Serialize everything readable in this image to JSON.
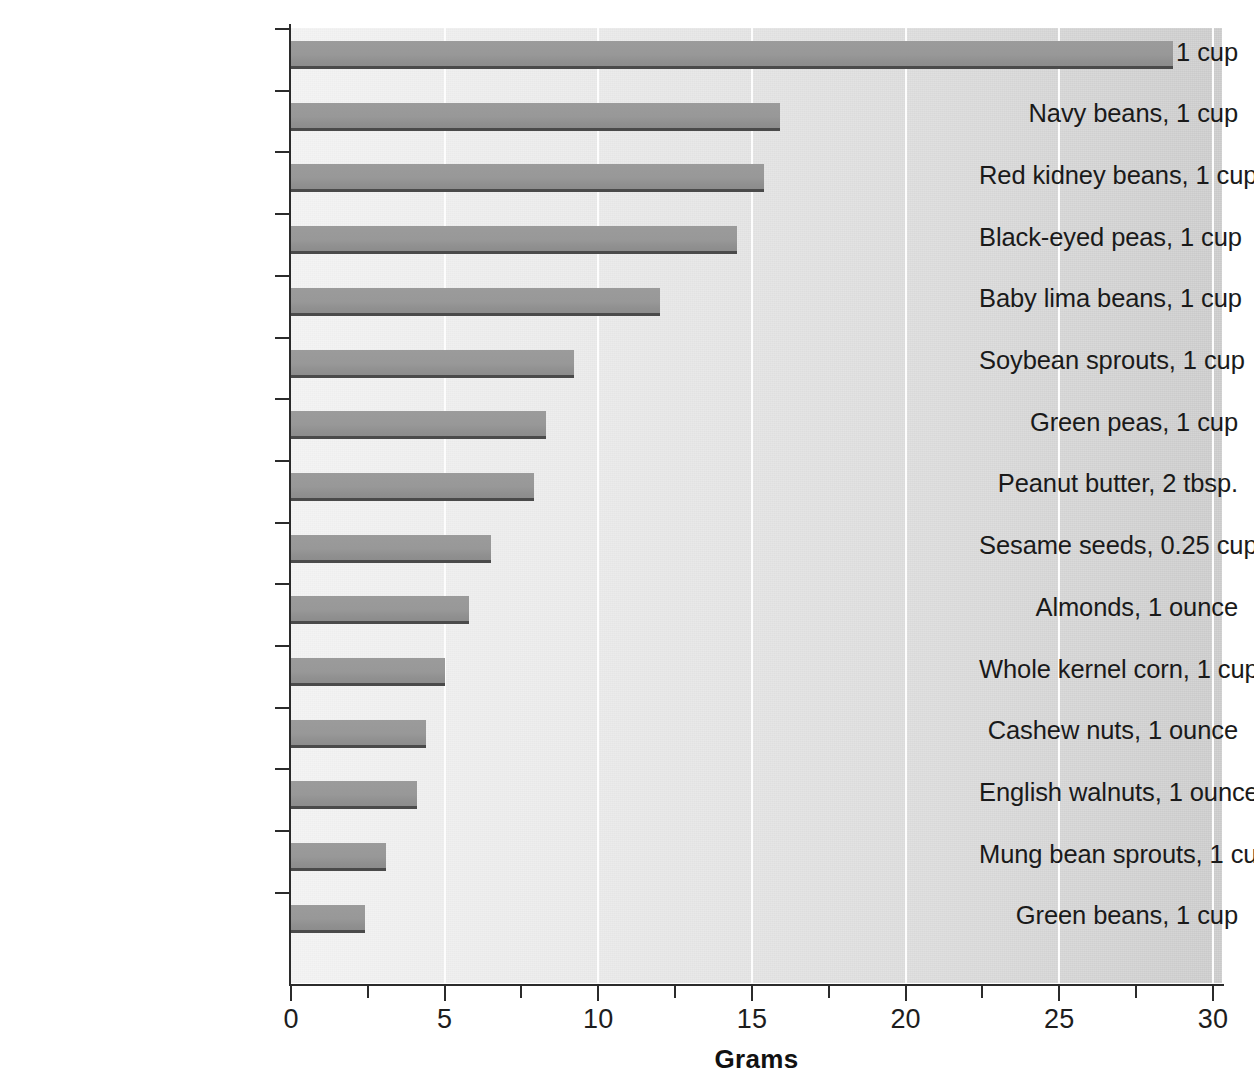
{
  "chart": {
    "type": "bar",
    "orientation": "horizontal",
    "xlabel": "Grams",
    "ylabel": "",
    "title": "",
    "grid": "vertical-white-gridlines",
    "legend": "none"
  },
  "axis": {
    "x_ticks": [
      "0",
      "5",
      "10",
      "15",
      "20",
      "25",
      "30"
    ],
    "x_tick_values": [
      0,
      5,
      10,
      15,
      20,
      25,
      30
    ],
    "x_minor_tick_values": [
      2.5,
      7.5,
      12.5,
      17.5,
      22.5,
      27.5
    ],
    "x_min": 0,
    "x_max": 30
  },
  "colors": {
    "bar_fill": "#989898",
    "bar_edge": "#4a4a4a",
    "axis": "#2b2b2b",
    "gridline": "#fdfdfd",
    "plot_background_left": "#f2f2f2",
    "plot_background_right": "#cbcbcb",
    "label_text": "#1a1a1a"
  },
  "chart_data": {
    "type": "bar",
    "orientation": "horizontal",
    "title": "",
    "xlabel": "Grams",
    "ylabel": "",
    "xlim": [
      0,
      30
    ],
    "grid": true,
    "legend": null,
    "categories": [
      "Soybeans, 1 cup",
      "Navy beans, 1 cup",
      "Red kidney beans, 1 cup",
      "Black-eyed peas, 1 cup",
      "Baby lima beans, 1 cup",
      "Soybean sprouts, 1 cup",
      "Green peas, 1 cup",
      "Peanut butter, 2 tbsp.",
      "Sesame seeds, 0.25 cup",
      "Almonds, 1 ounce",
      "Whole kernel corn, 1 cup",
      "Cashew nuts, 1 ounce",
      "English walnuts, 1 ounce",
      "Mung bean sprouts, 1 cup",
      "Green beans, 1 cup"
    ],
    "values": [
      28.7,
      15.9,
      15.4,
      14.5,
      12.0,
      9.2,
      8.3,
      7.9,
      6.5,
      5.8,
      5.0,
      4.4,
      4.1,
      3.1,
      2.4
    ],
    "ticks": [
      0,
      5,
      10,
      15,
      20,
      25,
      30
    ],
    "tick_labels": [
      "0",
      "5",
      "10",
      "15",
      "20",
      "25",
      "30"
    ]
  }
}
